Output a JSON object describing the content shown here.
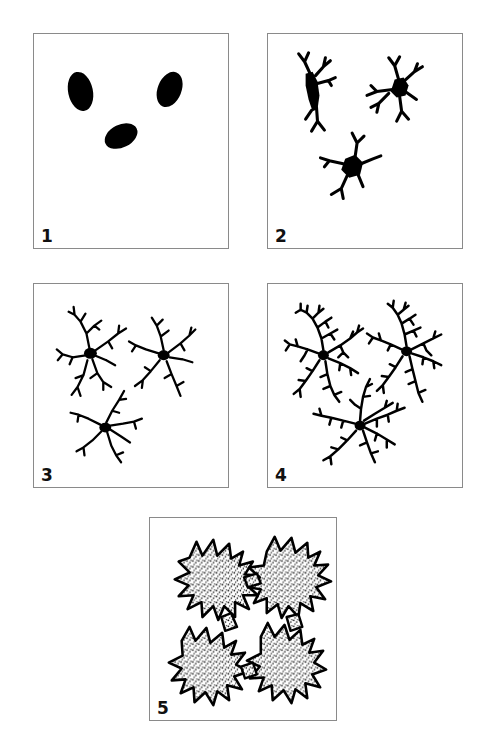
{
  "figure": {
    "type": "multi-panel-diagram",
    "panel_count": 5,
    "background_color": "#ffffff",
    "ink_color": "#000000",
    "border_color": "#8a8a8a",
    "layout": "two-rows-of-two-plus-one-centered"
  },
  "panels": [
    {
      "label": "1",
      "stage_name": "amoeboid",
      "cell_count": 3,
      "description": "Three solid dark ovoid cell bodies with no visible processes",
      "branch_order": 0
    },
    {
      "label": "2",
      "stage_name": "early-ramified",
      "cell_count": 3,
      "description": "Spindle-shaped somata bearing a few short stout forking primary processes",
      "branch_order": 1
    },
    {
      "label": "3",
      "stage_name": "ramified",
      "cell_count": 3,
      "description": "Small dark somata with slender radiating branches and secondary twigs",
      "branch_order": 2
    },
    {
      "label": "4",
      "stage_name": "highly-ramified",
      "cell_count": 3,
      "description": "Densely arborized cells with fine tertiary branching filling the field",
      "branch_order": 3
    },
    {
      "label": "5",
      "stage_name": "hypertrophic-reactive",
      "cell_count": 4,
      "description": "Hypertrophied stippled cell bodies with thick spiky outlines forming an interconnected network",
      "branch_order": 1
    }
  ],
  "caption": {
    "clipped_text": ""
  }
}
